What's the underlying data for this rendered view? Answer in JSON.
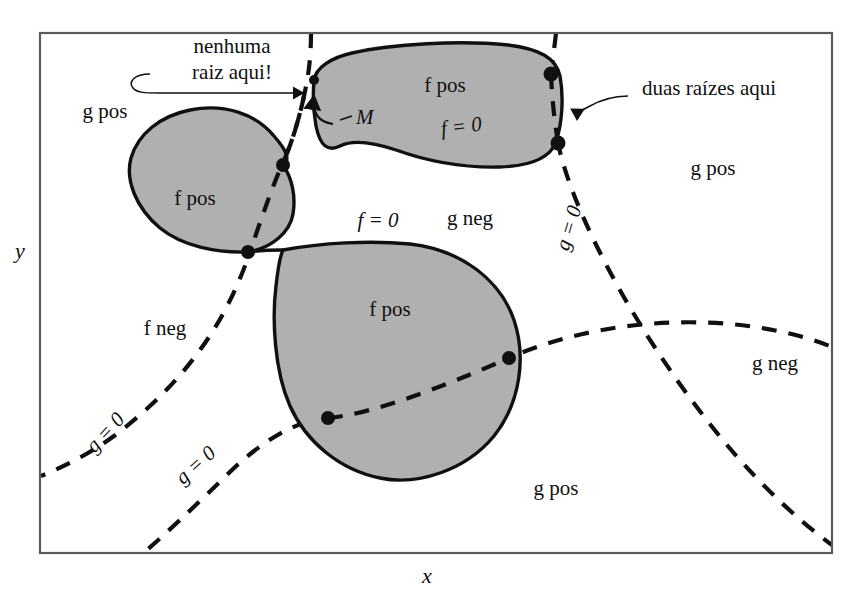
{
  "figure": {
    "axes": {
      "x_label": "x",
      "y_label": "y"
    },
    "colors": {
      "region_fill": "#b0b0b0",
      "region_stroke": "#101010",
      "curve_dashed": "#101010",
      "frame": "#5a5a5a",
      "text": "#101010",
      "background": "#ffffff"
    },
    "annotations": {
      "no_root": "nenhuma\nraiz aqui!",
      "no_root_line1": "nenhuma",
      "no_root_line2": "raiz aqui!",
      "two_roots": "duas raízes aqui",
      "point_m": "M"
    },
    "region_labels": [
      {
        "name": "g-pos-top-left",
        "text": "g pos",
        "x": 105,
        "y": 118
      },
      {
        "name": "f-pos-left-blob",
        "text": "f pos",
        "x": 195,
        "y": 205
      },
      {
        "name": "f-pos-top-blob",
        "text": "f pos",
        "x": 445,
        "y": 92
      },
      {
        "name": "f-pos-center-blob",
        "text": "f pos",
        "x": 390,
        "y": 316
      },
      {
        "name": "f-neg-lower-left",
        "text": "f neg",
        "x": 165,
        "y": 335
      },
      {
        "name": "g-neg-center",
        "text": "g neg",
        "x": 470,
        "y": 225
      },
      {
        "name": "g-neg-right",
        "text": "g neg",
        "x": 775,
        "y": 370
      },
      {
        "name": "g-pos-right",
        "text": "g pos",
        "x": 713,
        "y": 175
      },
      {
        "name": "g-pos-bottom",
        "text": "g pos",
        "x": 556,
        "y": 495
      }
    ],
    "curve_labels": [
      {
        "name": "f-zero-center",
        "text": "f = 0",
        "x": 378,
        "y": 227,
        "rotation": 0,
        "italic": true
      },
      {
        "name": "f-zero-top",
        "text": "f = 0",
        "x": 462,
        "y": 133,
        "rotation": -7,
        "italic": true
      },
      {
        "name": "g-zero-left",
        "text": "g = 0",
        "x": 110,
        "y": 437,
        "rotation": -47,
        "italic": true
      },
      {
        "name": "g-zero-mid",
        "text": "g = 0",
        "x": 200,
        "y": 470,
        "rotation": -42,
        "italic": true
      },
      {
        "name": "g-zero-right",
        "text": "g = 0",
        "x": 575,
        "y": 230,
        "rotation": -73,
        "italic": true
      }
    ],
    "intersection_points": [
      {
        "name": "pt-left-upper",
        "x": 283,
        "y": 165
      },
      {
        "name": "pt-left-lower",
        "x": 248,
        "y": 252
      },
      {
        "name": "pt-top-left-m",
        "x": 314,
        "y": 80
      },
      {
        "name": "pt-top-right-up",
        "x": 551,
        "y": 74
      },
      {
        "name": "pt-top-right-dn",
        "x": 558,
        "y": 143
      },
      {
        "name": "pt-center-right",
        "x": 509,
        "y": 358
      },
      {
        "name": "pt-center-low",
        "x": 328,
        "y": 418
      }
    ],
    "frame": {
      "x": 40,
      "y": 33,
      "width": 792,
      "height": 520
    }
  }
}
